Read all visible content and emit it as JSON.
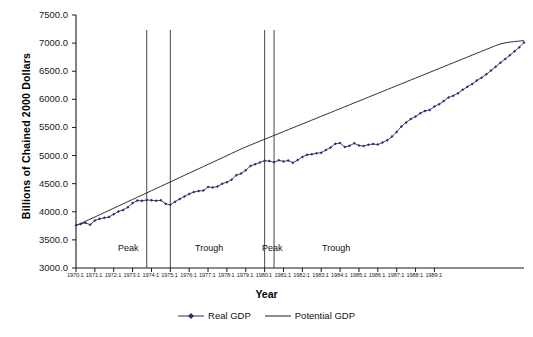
{
  "chart_data": {
    "type": "line",
    "title": "",
    "xlabel": "Year",
    "ylabel": "Billions of Chained 2000 Dollars",
    "ylim": [
      3000.0,
      7500.0
    ],
    "ytick_labels": [
      "3000.0",
      "3500.0",
      "4000.0",
      "4500.0",
      "5000.0",
      "5500.0",
      "6000.0",
      "6500.0",
      "7000.0",
      "7500.0"
    ],
    "ytick_values": [
      3000,
      3500,
      4000,
      4500,
      5000,
      5500,
      6000,
      6500,
      7000,
      7500
    ],
    "grid": false,
    "legend_position": "bottom-center",
    "x_tick_labels": [
      "1970:1",
      "1971:1",
      "1972:1",
      "1973:1",
      "1974:1",
      "1975:1",
      "1976:1",
      "1977:1",
      "1978:1",
      "1979:1",
      "1980:1",
      "1981:1",
      "1982:1",
      "1983:1",
      "1984:1",
      "1985:1",
      "1986:1",
      "1987:1",
      "1988:1",
      "1989:1"
    ],
    "x_start": "1970:1",
    "x_end": "1989:4",
    "x_frequency": "quarterly",
    "annotations": [
      {
        "label": "Peak",
        "x": "1973:4"
      },
      {
        "label": "Trough",
        "x": "1975:1"
      },
      {
        "label": "Peak",
        "x": "1980:1"
      },
      {
        "label": "Trough",
        "x": "1982:4"
      }
    ],
    "reference_lines": [
      {
        "kind": "peak",
        "x": "1973:4"
      },
      {
        "kind": "trough",
        "x": "1975:1"
      },
      {
        "kind": "peak",
        "x": "1980:1"
      },
      {
        "kind": "trough",
        "x": "1980:3"
      }
    ],
    "series": [
      {
        "name": "Real GDP",
        "color": "#2b2f6e",
        "marker": "diamond",
        "values": [
          3759,
          3783,
          3804,
          3770,
          3843,
          3874,
          3892,
          3905,
          3958,
          4005,
          4032,
          4081,
          4154,
          4199,
          4194,
          4210,
          4204,
          4196,
          4203,
          4144,
          4123,
          4180,
          4228,
          4272,
          4318,
          4352,
          4370,
          4378,
          4442,
          4433,
          4449,
          4499,
          4527,
          4570,
          4651,
          4680,
          4739,
          4816,
          4846,
          4878,
          4906,
          4902,
          4882,
          4916,
          4896,
          4911,
          4873,
          4920,
          4974,
          5014,
          5023,
          5039,
          5052,
          5099,
          5144,
          5208,
          5222,
          5153,
          5173,
          5218,
          5177,
          5169,
          5194,
          5205,
          5195,
          5232,
          5271,
          5339,
          5420,
          5518,
          5590,
          5652,
          5694,
          5754,
          5793,
          5811,
          5872,
          5913,
          5969,
          6034,
          6065,
          6109,
          6169,
          6223,
          6272,
          6336,
          6385,
          6445,
          6514,
          6580,
          6651,
          6719,
          6783,
          6857,
          6926,
          7010
        ]
      },
      {
        "name": "Potential GDP",
        "color": "#2b2f6e",
        "marker": "none",
        "values": [
          3755,
          3793,
          3831,
          3869,
          3907,
          3946,
          3985,
          4024,
          4063,
          4102,
          4141,
          4180,
          4219,
          4258,
          4297,
          4336,
          4375,
          4414,
          4453,
          4492,
          4531,
          4570,
          4609,
          4648,
          4687,
          4726,
          4765,
          4804,
          4843,
          4882,
          4921,
          4960,
          4999,
          5038,
          5077,
          5116,
          5152,
          5188,
          5222,
          5256,
          5290,
          5324,
          5358,
          5392,
          5426,
          5460,
          5494,
          5528,
          5562,
          5596,
          5630,
          5664,
          5698,
          5732,
          5766,
          5800,
          5834,
          5868,
          5902,
          5936,
          5970,
          6004,
          6038,
          6072,
          6106,
          6140,
          6174,
          6208,
          6242,
          6276,
          6310,
          6344,
          6378,
          6412,
          6446,
          6480,
          6514,
          6548,
          6582,
          6616,
          6650,
          6684,
          6718,
          6752,
          6786,
          6820,
          6854,
          6888,
          6922,
          6956,
          6985,
          7005,
          7018,
          7028,
          7036,
          7045
        ]
      }
    ],
    "legend": [
      {
        "label": "Real GDP",
        "color": "#2b2f6e",
        "style": "line-with-marker"
      },
      {
        "label": "Potential GDP",
        "color": "#1a1a1a",
        "style": "line"
      }
    ]
  }
}
